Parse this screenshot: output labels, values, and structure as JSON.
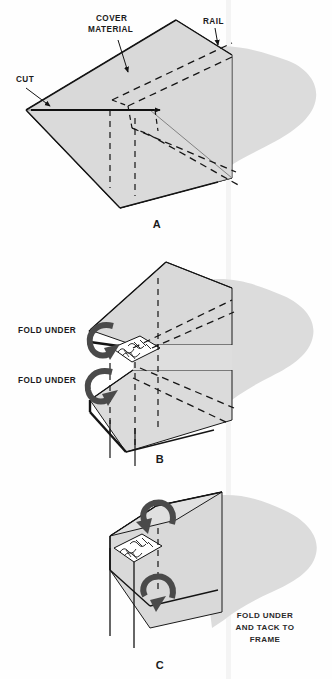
{
  "figure": {
    "panels": [
      {
        "id": "A",
        "letter": "A",
        "labels": [
          {
            "name": "cover-material",
            "text_lines": [
              "COVER",
              "MATERIAL"
            ]
          },
          {
            "name": "rail",
            "text_lines": [
              "RAIL"
            ]
          },
          {
            "name": "cut",
            "text_lines": [
              "CUT"
            ]
          }
        ]
      },
      {
        "id": "B",
        "letter": "B",
        "labels": [
          {
            "name": "fold-under-upper",
            "text_lines": [
              "FOLD UNDER"
            ]
          },
          {
            "name": "fold-under-lower",
            "text_lines": [
              "FOLD UNDER"
            ]
          }
        ]
      },
      {
        "id": "C",
        "letter": "C",
        "labels": [
          {
            "name": "fold-under-and-tack",
            "text_lines": [
              "FOLD UNDER",
              "AND TACK TO",
              "FRAME"
            ]
          }
        ]
      }
    ],
    "text": {
      "cover_material_line1": "COVER",
      "cover_material_line2": "MATERIAL",
      "rail": "RAIL",
      "cut": "CUT",
      "fold_under_b1": "FOLD UNDER",
      "fold_under_b2": "FOLD UNDER",
      "fold_tack_line1": "FOLD UNDER",
      "fold_tack_line2": "AND TACK TO",
      "fold_tack_line3": "FRAME",
      "letter_a": "A",
      "letter_b": "B",
      "letter_c": "C"
    },
    "colors": {
      "background": "#fefefe",
      "fabric_fill": "#d9d9d9",
      "fabric_fill_light": "#e2e2e2",
      "outline": "#1a1a1a",
      "heavy_edge": "#111111",
      "dashed": "#151515",
      "arrow": "#4a4a4a",
      "gutter": "#f2f2f2",
      "text": "#1b1b1b"
    }
  }
}
